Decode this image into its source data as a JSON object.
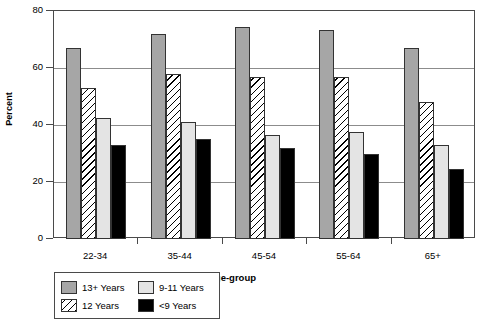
{
  "chart_data": {
    "type": "bar",
    "title": "",
    "xlabel": "Age-group",
    "ylabel": "Percent",
    "categories": [
      "22-34",
      "35-44",
      "45-54",
      "55-64",
      "65+"
    ],
    "series": [
      {
        "name": "13+ Years",
        "values": [
          67,
          72,
          74.5,
          73.5,
          67
        ]
      },
      {
        "name": "12 Years",
        "values": [
          53,
          58,
          57,
          57,
          48
        ]
      },
      {
        "name": "9-11 Years",
        "values": [
          42.5,
          41,
          36.5,
          37.5,
          33
        ]
      },
      {
        "name": "<9 Years",
        "values": [
          33,
          35,
          32,
          30,
          24.5
        ]
      }
    ],
    "ylim": [
      0,
      80
    ],
    "yticks": [
      0,
      20,
      40,
      60,
      80
    ],
    "ytick_labels": [
      "0",
      "20",
      "40",
      "60",
      "80"
    ],
    "grid": true,
    "grid_axis": "y",
    "legend_position": "below-left",
    "legend_order": [
      "13+ Years",
      "9-11 Years",
      "12 Years",
      "<9 Years"
    ],
    "colors": {
      "13+ Years": "#a6a6a6",
      "12 Years": "#ffffff",
      "9-11 Years": "#e4e4e4",
      "<9 Years": "#000000",
      "axis": "#4a4a4a",
      "grid": "#8c8c8c",
      "bar_outline": "#333333",
      "background": "#ffffff"
    }
  }
}
